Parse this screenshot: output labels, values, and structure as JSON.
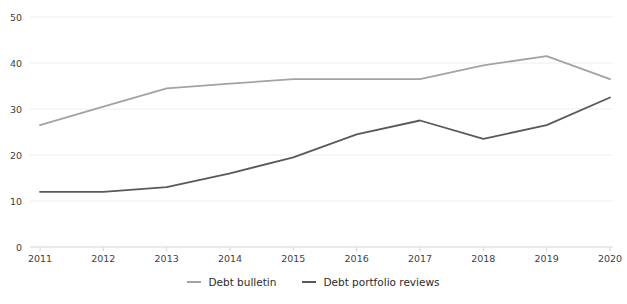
{
  "chart_data": {
    "type": "line",
    "title": "",
    "xlabel": "",
    "ylabel": "",
    "categories": [
      "2011",
      "2012",
      "2013",
      "2014",
      "2015",
      "2016",
      "2017",
      "2018",
      "2019",
      "2020"
    ],
    "series": [
      {
        "name": "Debt bulletin",
        "color": "#a3a3a3",
        "values": [
          26.5,
          30.5,
          34.5,
          35.5,
          36.5,
          36.5,
          36.5,
          39.5,
          41.5,
          36.5
        ]
      },
      {
        "name": "Debt portfolio reviews",
        "color": "#595959",
        "values": [
          12,
          12,
          13,
          16,
          19.5,
          24.5,
          27.5,
          23.5,
          26.5,
          32.5
        ]
      }
    ],
    "ylim": [
      0,
      50
    ],
    "yticks": [
      0,
      10,
      20,
      30,
      40,
      50
    ],
    "grid": "horizontal",
    "legend_position": "bottom-center",
    "style": {
      "grid_color": "#eeeeee",
      "axis_color": "#d6d6d6",
      "tick_label_color": "#3f3f3f",
      "legend_text_color": "#2b2b2b",
      "background_color": "#ffffff"
    }
  }
}
